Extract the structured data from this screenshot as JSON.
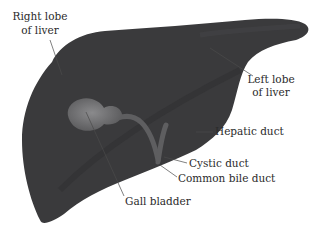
{
  "diagram": {
    "colors": {
      "liver": "#3a3a3c",
      "liver_shade": "#2e2e30",
      "gall_bladder": "#6e6e70",
      "duct": "#5e5e60",
      "leader_line": "#4a4a4a",
      "label_text": "#2b2b2b",
      "background": "#ffffff"
    },
    "labels": {
      "right_lobe_line1": "Right lobe",
      "right_lobe_line2": "of liver",
      "left_lobe_line1": "Left lobe",
      "left_lobe_line2": "of liver",
      "hepatic_duct": "Hepatic duct",
      "cystic_duct": "Cystic duct",
      "common_bile_duct": "Common bile duct",
      "gall_bladder": "Gall bladder"
    }
  }
}
